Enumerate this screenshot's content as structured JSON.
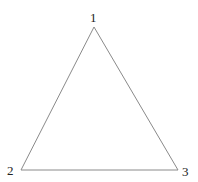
{
  "diagram": {
    "type": "triangle",
    "stroke_color": "#8a8a8a",
    "vertices": [
      {
        "label": "1",
        "x": 94,
        "y": 27
      },
      {
        "label": "2",
        "x": 21,
        "y": 170
      },
      {
        "label": "3",
        "x": 178,
        "y": 170
      }
    ]
  }
}
